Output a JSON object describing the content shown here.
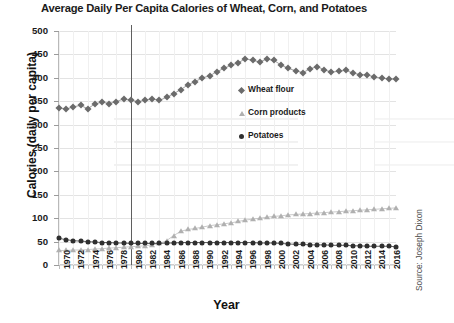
{
  "title": "Average Daily Per Capita Calories of Wheat, Corn, and Potatoes",
  "source_note": "Source: Joseph Dixon",
  "legend": [
    {
      "label": "Wheat flour",
      "marker": "diamond-marker",
      "color": "#6b6b6b"
    },
    {
      "label": "Corn products",
      "marker": "triangle-marker",
      "color": "#b0b0b0"
    },
    {
      "label": "Potatoes",
      "marker": "circle-marker",
      "color": "#2f2f2f"
    }
  ],
  "annotations": {
    "vertical_reference_line_year": 1980
  },
  "chart_data": {
    "type": "line",
    "title": "Average Daily Per Capita Calories of Wheat, Corn, and Potatoes",
    "xlabel": "Year",
    "ylabel": "Calories (daily per capita)",
    "xlim": [
      1970,
      2017
    ],
    "ylim": [
      0,
      500
    ],
    "yticks": [
      0,
      50,
      100,
      150,
      200,
      250,
      300,
      350,
      400,
      450,
      500
    ],
    "xticks": [
      1970,
      1972,
      1974,
      1976,
      1978,
      1980,
      1982,
      1984,
      1986,
      1988,
      1990,
      1992,
      1994,
      1996,
      1998,
      2000,
      2002,
      2004,
      2006,
      2008,
      2010,
      2012,
      2014,
      2016
    ],
    "grid": true,
    "legend_position": "center-right-inside",
    "x": [
      1970,
      1971,
      1972,
      1973,
      1974,
      1975,
      1976,
      1977,
      1978,
      1979,
      1980,
      1981,
      1982,
      1983,
      1984,
      1985,
      1986,
      1987,
      1988,
      1989,
      1990,
      1991,
      1992,
      1993,
      1994,
      1995,
      1996,
      1997,
      1998,
      1999,
      2000,
      2001,
      2002,
      2003,
      2004,
      2005,
      2006,
      2007,
      2008,
      2009,
      2010,
      2011,
      2012,
      2013,
      2014,
      2015,
      2016,
      2017
    ],
    "series": [
      {
        "name": "Wheat flour",
        "marker": "diamond",
        "color": "#6b6b6b",
        "values": [
          336,
          333,
          338,
          341,
          334,
          344,
          348,
          345,
          349,
          355,
          352,
          349,
          352,
          355,
          352,
          358,
          366,
          375,
          385,
          392,
          400,
          404,
          413,
          420,
          427,
          432,
          441,
          437,
          434,
          440,
          437,
          427,
          420,
          415,
          411,
          419,
          424,
          417,
          412,
          414,
          416,
          410,
          407,
          406,
          402,
          399,
          398,
          397
        ]
      },
      {
        "name": "Corn products",
        "marker": "triangle",
        "color": "#b0b0b0",
        "values": [
          31,
          31,
          32,
          32,
          33,
          34,
          35,
          36,
          37,
          38,
          39,
          40,
          41,
          43,
          46,
          52,
          63,
          72,
          76,
          78,
          81,
          84,
          86,
          88,
          90,
          93,
          96,
          98,
          100,
          102,
          104,
          105,
          107,
          108,
          109,
          110,
          111,
          112,
          113,
          114,
          115,
          116,
          117,
          118,
          119,
          120,
          121,
          122
        ]
      },
      {
        "name": "Potatoes",
        "marker": "circle",
        "color": "#2f2f2f",
        "values": [
          57,
          54,
          52,
          51,
          50,
          49,
          48,
          48,
          47,
          47,
          46,
          46,
          46,
          46,
          46,
          47,
          47,
          48,
          48,
          48,
          48,
          48,
          48,
          48,
          48,
          48,
          48,
          48,
          47,
          47,
          47,
          46,
          45,
          44,
          44,
          43,
          43,
          43,
          42,
          42,
          42,
          41,
          41,
          40,
          40,
          40,
          40,
          39
        ]
      }
    ]
  }
}
